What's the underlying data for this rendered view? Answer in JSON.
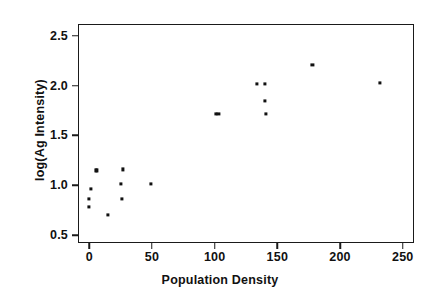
{
  "chart_data": {
    "type": "scatter",
    "title": "",
    "xlabel": "Population Density",
    "ylabel": "log(Ag Intensity)",
    "xlim": [
      -9,
      259
    ],
    "ylim": [
      0.42,
      2.62
    ],
    "xticks": [
      0,
      50,
      100,
      150,
      200,
      250
    ],
    "xtick_labels": [
      "0",
      "50",
      "100",
      "150",
      "200",
      "250"
    ],
    "yticks": [
      0.5,
      1.0,
      1.5,
      2.0,
      2.5
    ],
    "ytick_labels": [
      "0.5",
      "1.0",
      "1.5",
      "2.0",
      "2.5"
    ],
    "grid": false,
    "legend": null,
    "marker": "square",
    "marker_color": "#111111",
    "frame_color": "#1a1a1a",
    "points": [
      {
        "x": 0,
        "y": 0.78
      },
      {
        "x": 0,
        "y": 0.86
      },
      {
        "x": 1,
        "y": 0.96
      },
      {
        "x": 5,
        "y": 1.15
      },
      {
        "x": 6,
        "y": 1.15
      },
      {
        "x": 15,
        "y": 0.7
      },
      {
        "x": 25,
        "y": 1.01
      },
      {
        "x": 26,
        "y": 0.86
      },
      {
        "x": 27,
        "y": 1.16
      },
      {
        "x": 49,
        "y": 1.01
      },
      {
        "x": 101,
        "y": 1.72
      },
      {
        "x": 103,
        "y": 1.72
      },
      {
        "x": 134,
        "y": 2.02
      },
      {
        "x": 140,
        "y": 2.02
      },
      {
        "x": 140,
        "y": 1.85
      },
      {
        "x": 141,
        "y": 1.72
      },
      {
        "x": 178,
        "y": 2.21
      },
      {
        "x": 232,
        "y": 2.03
      }
    ]
  }
}
